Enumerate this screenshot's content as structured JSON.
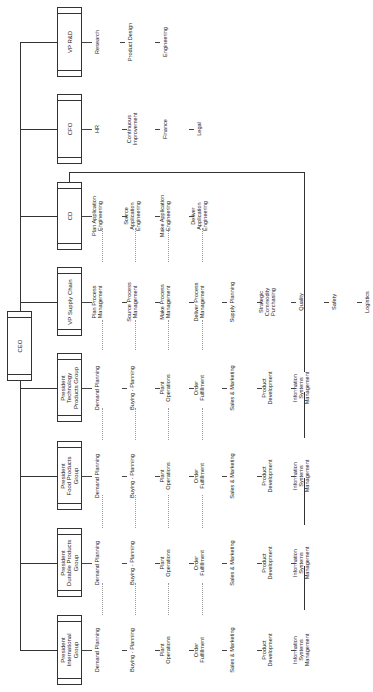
{
  "chart_title": "",
  "ceo": {
    "label": "CEO"
  },
  "executives": [
    {
      "label": "VP R&D",
      "children": [
        "Research",
        "Product Design",
        "Engineering"
      ]
    },
    {
      "label": "CFO",
      "children": [
        "HR",
        "Continuous\nImprovement",
        "Finance",
        "Legal"
      ]
    },
    {
      "label": "CD",
      "children": [
        "Plan Application\nEngineering",
        "Source\nApplication\nEngineering",
        "Make Application\nEngineering",
        "Deliver\nApplication\nEngineering"
      ]
    },
    {
      "label": "VP Supply Chain",
      "children": [
        "Plan Process\nManagement",
        "Source Process\nManagement",
        "Make Process\nManagement",
        "Deliver Process\nManagement",
        "Supply Planning",
        "Strategic\nCommodity\nPurchasing",
        "Quality",
        "Safety",
        "Logistics"
      ]
    },
    {
      "label": "President\nTechnology\nProducts Group",
      "children": [
        "Demand Planning",
        "Buying - Planning",
        "Plant\nOperations",
        "Order\nFulfillment",
        "Sales & Marketing",
        "Product\nDevelopment",
        "Information\nSystems\nManagement"
      ]
    },
    {
      "label": "President\nFood Products\nGroup",
      "children": [
        "Demand Planning",
        "Buying - Planning",
        "Plant\nOperations",
        "Order\nFulfillment",
        "Sales & Marketing",
        "Product\nDevelopment",
        "Information\nSystems\nManagement"
      ]
    },
    {
      "label": "President\nDurable Products\nGroup",
      "children": [
        "Demand Planning",
        "Buying - Planning",
        "Plant\nOperations",
        "Order\nFulfillment",
        "Sales & Marketing",
        "Product\nDevelopment",
        "Information\nSystems\nManagement"
      ]
    },
    {
      "label": "President\nInternational\nGroup",
      "children": [
        "Demand Planning",
        "Buying - Planning",
        "Plant\nOperations",
        "Order\nFulfillment",
        "Sales & Marketing",
        "Product\nDevelopment",
        "Information\nSystems\nManagement"
      ]
    }
  ]
}
